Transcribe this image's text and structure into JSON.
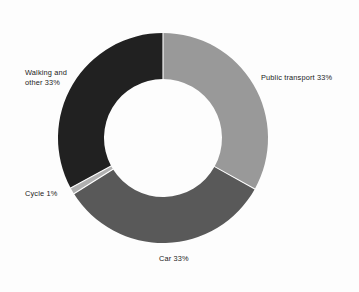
{
  "chart_data": {
    "type": "pie",
    "variant": "donut",
    "title": "",
    "subtitle": "",
    "xlabel": "",
    "ylabel": "",
    "legend": "none",
    "grid": false,
    "unit": "%",
    "start_angle_deg": 0,
    "direction": "clockwise",
    "categories": [
      "Public transport",
      "Car",
      "Cycle",
      "Walking and other"
    ],
    "values": [
      33,
      33,
      1,
      33
    ],
    "labels": [
      "Public transport 33%",
      "Car 33%",
      "Cycle 1%",
      "Walking and other 33%"
    ],
    "colors": [
      "#999999",
      "#595959",
      "#b0b0b0",
      "#212121"
    ],
    "slices": [
      {
        "name": "Public transport",
        "value": 33,
        "label": "Public transport 33%",
        "color": "#999999",
        "start_deg": 0,
        "end_deg": 119
      },
      {
        "name": "Car",
        "value": 33,
        "label": "Car 33%",
        "color": "#595959",
        "start_deg": 119,
        "end_deg": 238
      },
      {
        "name": "Cycle",
        "value": 1,
        "label": "Cycle 1%",
        "color": "#b0b0b0",
        "start_deg": 238,
        "end_deg": 241.6
      },
      {
        "name": "Walking and other",
        "value": 33,
        "label": "Walking and other 33%",
        "color": "#212121",
        "start_deg": 241.6,
        "end_deg": 360
      }
    ]
  },
  "figure": {
    "background_color": "#fdfdfd",
    "separator_color": "#ffffff",
    "text_color": "#1b1b1b"
  },
  "labels": {
    "public_transport": "Public transport 33%",
    "car": "Car 33%",
    "cycle": "Cycle 1%",
    "walking_other_line1": "Walking and",
    "walking_other_line2": "other 33%",
    "walking_other": "Walking and\nother 33%"
  }
}
